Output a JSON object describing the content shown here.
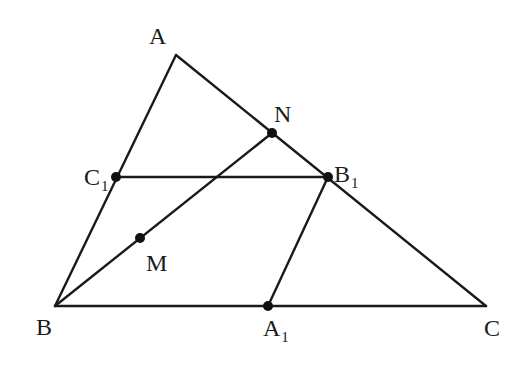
{
  "diagram": {
    "type": "triangle-midpoints",
    "stroke_color": "#1a1a1a",
    "points": {
      "A": {
        "x": 176,
        "y": 55
      },
      "B": {
        "x": 55,
        "y": 306
      },
      "C": {
        "x": 486,
        "y": 306
      },
      "C1": {
        "x": 116,
        "y": 177
      },
      "B1": {
        "x": 328,
        "y": 177
      },
      "A1": {
        "x": 268,
        "y": 306
      },
      "N": {
        "x": 272,
        "y": 133
      },
      "M": {
        "x": 140,
        "y": 238
      }
    },
    "segments": [
      [
        "A",
        "B"
      ],
      [
        "A",
        "C"
      ],
      [
        "B",
        "C"
      ],
      [
        "C1",
        "B1"
      ],
      [
        "B1",
        "A1"
      ],
      [
        "B",
        "N"
      ]
    ],
    "dots": [
      "C1",
      "B1",
      "A1",
      "N",
      "M"
    ],
    "labels": {
      "A": {
        "main": "A",
        "sub": ""
      },
      "B": {
        "main": "B",
        "sub": ""
      },
      "C": {
        "main": "C",
        "sub": ""
      },
      "N": {
        "main": "N",
        "sub": ""
      },
      "M": {
        "main": "M",
        "sub": ""
      },
      "C1": {
        "main": "C",
        "sub": "1"
      },
      "B1": {
        "main": "B",
        "sub": "1"
      },
      "A1": {
        "main": "A",
        "sub": "1"
      }
    }
  }
}
